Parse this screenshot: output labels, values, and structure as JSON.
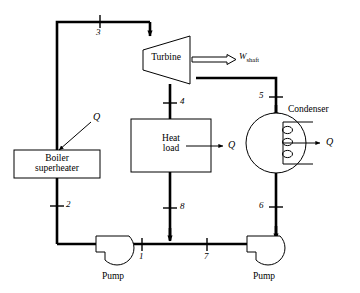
{
  "diagram": {
    "line_color": "#000000",
    "fill_color": "#ffffff"
  },
  "equipment": {
    "boiler": {
      "name": "boiler-superheater",
      "label_line1": "Boiler",
      "label_line2": "superheater"
    },
    "turbine": {
      "name": "turbine",
      "label": "Turbine"
    },
    "heat_load": {
      "name": "heat-load",
      "label_line1": "Heat",
      "label_line2": "load"
    },
    "condenser": {
      "name": "condenser",
      "label": "Condenser"
    },
    "pump_left": {
      "name": "pump-left",
      "label": "Pump"
    },
    "pump_right": {
      "name": "pump-right",
      "label": "Pump"
    }
  },
  "streams": [
    {
      "id": "1",
      "label": "1"
    },
    {
      "id": "2",
      "label": "2"
    },
    {
      "id": "3",
      "label": "3"
    },
    {
      "id": "4",
      "label": "4"
    },
    {
      "id": "5",
      "label": "5"
    },
    {
      "id": "6",
      "label": "6"
    },
    {
      "id": "7",
      "label": "7"
    },
    {
      "id": "8",
      "label": "8"
    }
  ],
  "energy_labels": {
    "boiler_heat": "Q",
    "heat_load_heat": "Q",
    "condenser_heat": "Q",
    "shaft_work_symbol": "W",
    "shaft_work_subscript": "shaft"
  }
}
